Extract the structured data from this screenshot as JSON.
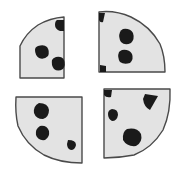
{
  "figure": {
    "width": 188,
    "height": 178,
    "background_color": "#ffffff",
    "cookie_fill_color": "#e3e3e3",
    "cookie_outline_color": "#4a4a4a",
    "chip_color": "#1a1a1a",
    "outline_width": 1.4,
    "piece_count": 4,
    "chip_count_total": 13
  },
  "pieces": [
    {
      "id": "piece-top-left",
      "label": "Top-left quarter",
      "position": "top-left",
      "arc_side": "outer upper-left",
      "straight_edges": [
        "right",
        "bottom"
      ],
      "chip_count": 3,
      "path": "M 64 17 L 64 78 L 20 78 L 20 46 Q 26 33 38 25 Q 50 18 64 17 Z",
      "chips": [
        {
          "id": "chip-tl-1",
          "label": "edge-cut chip at top right",
          "path": "M 57 20 L 64 20 L 64 31 L 60 31 Q 55 29 55 25 Q 55 21 57 20 Z"
        },
        {
          "id": "chip-tl-2",
          "label": "left chip",
          "path": "M 38 46 Q 44 44 47 47 Q 50 51 48 56 Q 44 60 39 58 Q 35 55 35 50 Q 35 47 38 46 Z"
        },
        {
          "id": "chip-tl-3",
          "label": "lower right chip",
          "path": "M 56 57 Q 62 56 64 60 Q 66 65 63 69 Q 58 72 54 69 Q 51 65 52 60 Q 53 58 56 57 Z"
        }
      ]
    },
    {
      "id": "piece-top-right",
      "label": "Top-right quarter",
      "position": "top-right",
      "arc_side": "outer upper-right",
      "straight_edges": [
        "left",
        "bottom"
      ],
      "chip_count": 4,
      "path": "M 99 12 L 165 12 L 165 72 L 99 72 Z",
      "path_outline": "M 99 12 Q 115 10 131 17 Q 150 26 160 44 Q 165 56 165 72 L 99 72 Z",
      "chips": [
        {
          "id": "chip-tr-1",
          "label": "small corner chip top left",
          "path": "M 99 13 L 105 13 L 103 22 Q 100 23 99 20 Z"
        },
        {
          "id": "chip-tr-2",
          "label": "upper middle chip",
          "path": "M 123 29 Q 130 28 133 33 Q 135 39 131 43 Q 125 46 121 42 Q 118 37 120 32 Q 121 30 123 29 Z"
        },
        {
          "id": "chip-tr-3",
          "label": "lower middle chip",
          "path": "M 122 50 Q 129 49 132 54 Q 134 59 130 63 Q 124 65 120 62 Q 117 57 119 52 Q 120 51 122 50 Z"
        },
        {
          "id": "chip-tr-4",
          "label": "small corner chip bottom left",
          "path": "M 100 65 L 106 66 L 106 72 L 100 72 Z"
        }
      ]
    },
    {
      "id": "piece-bottom-left",
      "label": "Bottom-left quarter",
      "position": "bottom-left",
      "arc_side": "outer lower-left",
      "straight_edges": [
        "top",
        "right"
      ],
      "chip_count": 3,
      "path": "M 16 97 L 82 97 L 82 163 Q 60 163 44 155 Q 26 145 18 126 Q 15 113 16 97 Z",
      "chips": [
        {
          "id": "chip-bl-1",
          "label": "top chip with flat top edge",
          "path": "M 39 103 Q 48 103 49 110 Q 49 117 43 119 Q 36 119 34 113 Q 33 106 39 103 Z"
        },
        {
          "id": "chip-bl-2",
          "label": "middle chip",
          "path": "M 40 126 Q 47 125 49 131 Q 50 137 45 140 Q 38 141 36 135 Q 35 129 40 126 Z"
        },
        {
          "id": "chip-bl-3",
          "label": "small half-moon chip at right",
          "path": "M 68 140 Q 76 140 76 145 Q 75 150 71 150 Q 67 149 67 144 Z"
        }
      ]
    },
    {
      "id": "piece-bottom-right",
      "label": "Bottom-right quarter",
      "position": "bottom-right",
      "arc_side": "outer lower-right",
      "straight_edges": [
        "top",
        "left"
      ],
      "chip_count": 4,
      "path": "M 104 89 L 170 89 Q 171 112 163 130 Q 152 148 134 155 Q 119 158 104 158 Z",
      "chips": [
        {
          "id": "chip-br-1",
          "label": "small chip top left cut by edge",
          "path": "M 104 90 L 112 90 L 111 97 Q 106 98 104 95 Z"
        },
        {
          "id": "chip-br-2",
          "label": "triangular chip upper right",
          "path": "M 145 94 L 158 96 L 150 110 Q 144 107 143 99 Z"
        },
        {
          "id": "chip-br-3",
          "label": "small oval chip left",
          "path": "M 112 109 Q 118 109 118 115 Q 117 121 112 121 Q 108 119 108 114 Q 108 110 112 109 Z"
        },
        {
          "id": "chip-br-4",
          "label": "large chip lower middle",
          "path": "M 127 129 Q 137 127 141 134 Q 143 142 136 146 Q 127 147 123 140 Q 122 132 127 129 Z"
        }
      ]
    }
  ]
}
